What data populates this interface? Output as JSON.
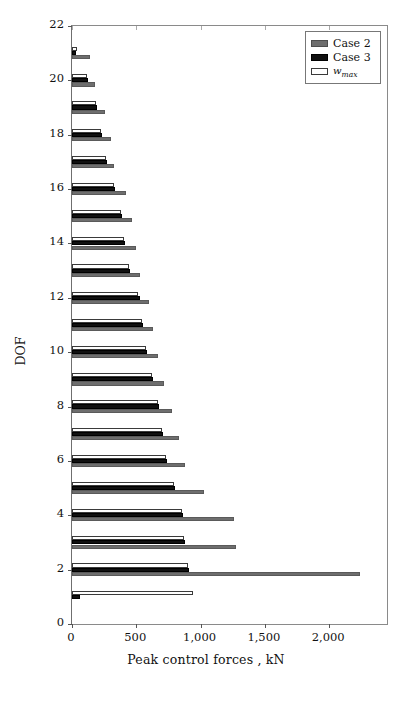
{
  "chart_data": {
    "type": "bar",
    "orientation": "horizontal",
    "title": "",
    "xlabel": "Peak control forces , kN",
    "ylabel": "DOF",
    "xlim": [
      0,
      2450
    ],
    "ylim": [
      0,
      22
    ],
    "xticks": [
      0,
      500,
      1000,
      1500,
      2000
    ],
    "xticklabels": [
      "0",
      "500",
      "1,000",
      "1,500",
      "2,000"
    ],
    "yticks": [
      0,
      2,
      4,
      6,
      8,
      10,
      12,
      14,
      16,
      18,
      20,
      22
    ],
    "yticklabels": [
      "0",
      "2",
      "4",
      "6",
      "8",
      "10",
      "12",
      "14",
      "16",
      "18",
      "20",
      "22"
    ],
    "grid": false,
    "legend_position": "upper right",
    "categories": [
      1,
      2,
      3,
      4,
      5,
      6,
      7,
      8,
      9,
      10,
      11,
      12,
      13,
      14,
      15,
      16,
      17,
      18,
      19,
      20,
      21
    ],
    "series": [
      {
        "name": "Case 2",
        "color": "#6e6e6e",
        "values": [
          0,
          2241,
          1276,
          1263,
          1030,
          876,
          830,
          776,
          714,
          665,
          633,
          602,
          525,
          494,
          463,
          417,
          325,
          301,
          255,
          178,
          139
        ]
      },
      {
        "name": "Case 3",
        "color": "#101010",
        "values": [
          62,
          912,
          880,
          866,
          803,
          741,
          710,
          680,
          633,
          587,
          556,
          525,
          448,
          409,
          386,
          332,
          271,
          232,
          193,
          124,
          31
        ]
      },
      {
        "name": "w_max",
        "color": "#ffffff",
        "values": [
          943,
          904,
          873,
          857,
          795,
          733,
          703,
          672,
          625,
          579,
          548,
          517,
          440,
          402,
          378,
          324,
          263,
          224,
          185,
          116,
          39
        ]
      }
    ]
  },
  "legend": {
    "items": [
      {
        "label": "Case 2",
        "style": "case2"
      },
      {
        "label": "Case 3",
        "style": "case3"
      },
      {
        "label": "w",
        "sub": "max",
        "style": "wmax"
      }
    ]
  }
}
